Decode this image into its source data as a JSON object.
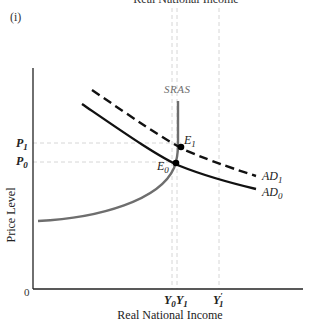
{
  "top_caption": "Real National Income",
  "panel_label": "(i)",
  "axes": {
    "y_label": "Price Level",
    "x_label": "Real National Income",
    "origin": "0"
  },
  "y_ticks": [
    {
      "label": "P",
      "sub": "1",
      "y": 143
    },
    {
      "label": "P",
      "sub": "0",
      "y": 162
    }
  ],
  "x_ticks": [
    {
      "label": "Y",
      "sub": "0",
      "x": 172
    },
    {
      "label": "Y",
      "sub": "1",
      "x": 177
    },
    {
      "label": "Y",
      "sub": "1",
      "prime": "′",
      "x": 219
    }
  ],
  "curves": {
    "sras": {
      "label": "SRAS",
      "color": "#6e6e6e"
    },
    "ad0": {
      "label": "AD",
      "sub": "0",
      "style": "solid",
      "color": "#111111"
    },
    "ad1": {
      "label": "AD",
      "sub": "1",
      "style": "dashed",
      "color": "#111111"
    }
  },
  "points": {
    "e0": {
      "label": "E",
      "sub": "0"
    },
    "e1": {
      "label": "E",
      "sub": "1"
    }
  },
  "colors": {
    "axis": "#222222",
    "guide": "#d6d6d6",
    "sras": "#6e6e6e",
    "ad": "#111111"
  }
}
